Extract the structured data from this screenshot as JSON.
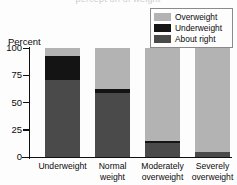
{
  "figure": {
    "cut_off_title": "percept on of weight",
    "ylabel": "Percent"
  },
  "legend": {
    "items": [
      {
        "label": "Overweight",
        "color": "#b3b3b3"
      },
      {
        "label": "Underweight",
        "color": "#141414"
      },
      {
        "label": "About right",
        "color": "#4a4a4a"
      }
    ]
  },
  "yaxis": {
    "ticks": [
      "100",
      "75",
      "50",
      "25",
      "0"
    ]
  },
  "xaxis": {
    "labels": [
      {
        "line1": "Underweight",
        "line2": ""
      },
      {
        "line1": "Normal",
        "line2": "weight"
      },
      {
        "line1": "Moderately",
        "line2": "overweight"
      },
      {
        "line1": "Severely",
        "line2": "overweight"
      }
    ]
  },
  "chart_data": {
    "type": "bar",
    "stacked": true,
    "title": "",
    "xlabel": "",
    "ylabel": "Percent",
    "ylim": [
      0,
      100
    ],
    "yticks": [
      0,
      25,
      50,
      75,
      100
    ],
    "grid": false,
    "legend_position": "top-right",
    "categories": [
      "Underweight",
      "Normal weight",
      "Moderately overweight",
      "Severely overweight"
    ],
    "series": [
      {
        "name": "About right",
        "color": "#4a4a4a",
        "values": [
          71,
          59,
          13,
          5
        ]
      },
      {
        "name": "Underweight",
        "color": "#141414",
        "values": [
          22,
          3,
          2,
          0
        ]
      },
      {
        "name": "Overweight",
        "color": "#b3b3b3",
        "values": [
          7,
          38,
          85,
          95
        ]
      }
    ]
  }
}
